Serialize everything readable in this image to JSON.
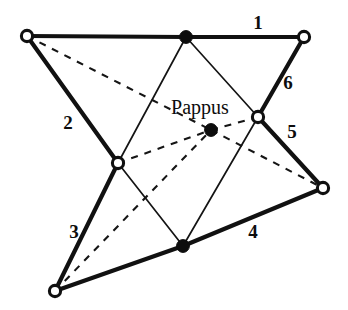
{
  "figure": {
    "kind": "geometry-diagram",
    "width": 348,
    "height": 310,
    "background_color": "#ffffff",
    "ink_color": "#0d0d0d",
    "center_label": "Pappus"
  },
  "edge_labels": [
    {
      "text": "1",
      "x": 258,
      "y": 22
    },
    {
      "text": "2",
      "x": 68,
      "y": 122
    },
    {
      "text": "3",
      "x": 74,
      "y": 231
    },
    {
      "text": "4",
      "x": 253,
      "y": 231
    },
    {
      "text": "5",
      "x": 292,
      "y": 131
    },
    {
      "text": "6",
      "x": 288,
      "y": 82
    }
  ],
  "caption": {
    "text": "Pappus",
    "x": 200,
    "y": 107
  },
  "nodes": [
    {
      "id": "A",
      "x": 27,
      "y": 36,
      "style": "open"
    },
    {
      "id": "B",
      "x": 186,
      "y": 37,
      "style": "filled"
    },
    {
      "id": "C",
      "x": 304,
      "y": 37,
      "style": "open"
    },
    {
      "id": "D",
      "x": 258,
      "y": 117,
      "style": "open"
    },
    {
      "id": "E",
      "x": 323,
      "y": 188,
      "style": "open"
    },
    {
      "id": "F",
      "x": 183,
      "y": 246,
      "style": "filled"
    },
    {
      "id": "G",
      "x": 55,
      "y": 291,
      "style": "open"
    },
    {
      "id": "H",
      "x": 118,
      "y": 163,
      "style": "open"
    },
    {
      "id": "P",
      "x": 211,
      "y": 130,
      "style": "filled"
    }
  ],
  "edges_thick": [
    {
      "from": "A",
      "to": "B",
      "label": "1"
    },
    {
      "from": "B",
      "to": "C",
      "label": "1"
    },
    {
      "from": "A",
      "to": "H",
      "label": "2"
    },
    {
      "from": "H",
      "to": "G",
      "label": "3"
    },
    {
      "from": "G",
      "to": "F",
      "label": "4"
    },
    {
      "from": "F",
      "to": "E",
      "label": "4"
    },
    {
      "from": "D",
      "to": "E",
      "label": "5"
    },
    {
      "from": "C",
      "to": "D",
      "label": "6"
    }
  ],
  "edges_thin": [
    {
      "from": "B",
      "to": "H"
    },
    {
      "from": "B",
      "to": "D"
    },
    {
      "from": "H",
      "to": "F"
    },
    {
      "from": "D",
      "to": "F"
    }
  ],
  "edges_dashed": [
    {
      "from": "A",
      "to": "P"
    },
    {
      "from": "H",
      "to": "P"
    },
    {
      "from": "P",
      "to": "D"
    },
    {
      "from": "P",
      "to": "E"
    },
    {
      "from": "G",
      "to": "P"
    }
  ]
}
